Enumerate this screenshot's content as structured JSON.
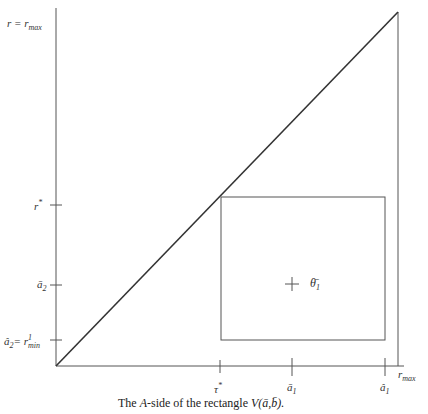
{
  "figure": {
    "caption_pre": "The ",
    "caption_italic": "A",
    "caption_post": "-side of the rectangle ",
    "caption_fn": "V(ā,b̄).",
    "y_axis": {
      "top_label": "r = r",
      "top_label_sub": "max",
      "ticks": [
        {
          "label": "r",
          "sup": "*",
          "y": 205
        },
        {
          "label": "ā",
          "sub": "2",
          "y": 285
        },
        {
          "label": "â",
          "sub": "2",
          "extra": "= r",
          "extra_sup": "1",
          "extra_sub": "min",
          "y": 340
        }
      ]
    },
    "x_axis": {
      "end_label": "r",
      "end_label_sub": "max",
      "ticks": [
        {
          "label": "τ",
          "sup": "*",
          "x": 220
        },
        {
          "label": "ā",
          "sub": "1",
          "x": 292
        },
        {
          "label": "â",
          "sub": "1",
          "x": 385
        }
      ]
    },
    "point": {
      "label": "θ̄",
      "sub": "1",
      "x": 292,
      "y": 284
    },
    "rectangle": {
      "x1": 221,
      "y1": 197,
      "x2": 385,
      "y2": 340
    },
    "origin": {
      "x": 56,
      "y": 366
    },
    "max_corner": {
      "x": 398,
      "y": 12
    }
  }
}
